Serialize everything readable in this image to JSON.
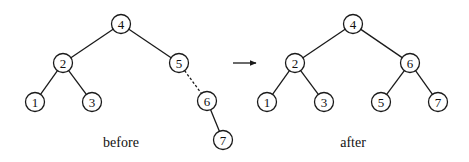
{
  "diagram": {
    "arrow": {
      "x1": 233,
      "y1": 63,
      "x2": 256,
      "y2": 63
    },
    "trees": [
      {
        "caption": "before",
        "caption_pos": [
          121,
          147
        ],
        "nodes": [
          {
            "id": "4",
            "label": "4",
            "x": 121,
            "y": 24
          },
          {
            "id": "2",
            "label": "2",
            "x": 63,
            "y": 63
          },
          {
            "id": "5",
            "label": "5",
            "x": 179,
            "y": 63
          },
          {
            "id": "1",
            "label": "1",
            "x": 35,
            "y": 102
          },
          {
            "id": "3",
            "label": "3",
            "x": 92,
            "y": 102
          },
          {
            "id": "6",
            "label": "6",
            "x": 207,
            "y": 101
          },
          {
            "id": "7",
            "label": "7",
            "x": 223,
            "y": 140
          }
        ],
        "edges": [
          {
            "from": "4",
            "to": "2",
            "style": "solid"
          },
          {
            "from": "4",
            "to": "5",
            "style": "solid"
          },
          {
            "from": "2",
            "to": "1",
            "style": "solid"
          },
          {
            "from": "2",
            "to": "3",
            "style": "solid"
          },
          {
            "from": "5",
            "to": "6",
            "style": "dashed"
          },
          {
            "from": "6",
            "to": "7",
            "style": "solid"
          }
        ]
      },
      {
        "caption": "after",
        "caption_pos": [
          353,
          147
        ],
        "nodes": [
          {
            "id": "4",
            "label": "4",
            "x": 353,
            "y": 24
          },
          {
            "id": "2",
            "label": "2",
            "x": 295,
            "y": 63
          },
          {
            "id": "6",
            "label": "6",
            "x": 410,
            "y": 63
          },
          {
            "id": "1",
            "label": "1",
            "x": 267,
            "y": 102
          },
          {
            "id": "3",
            "label": "3",
            "x": 324,
            "y": 102
          },
          {
            "id": "5",
            "label": "5",
            "x": 381,
            "y": 102
          },
          {
            "id": "7",
            "label": "7",
            "x": 438,
            "y": 102
          }
        ],
        "edges": [
          {
            "from": "4",
            "to": "2",
            "style": "solid"
          },
          {
            "from": "4",
            "to": "6",
            "style": "solid"
          },
          {
            "from": "2",
            "to": "1",
            "style": "solid"
          },
          {
            "from": "2",
            "to": "3",
            "style": "solid"
          },
          {
            "from": "6",
            "to": "5",
            "style": "solid"
          },
          {
            "from": "6",
            "to": "7",
            "style": "solid"
          }
        ]
      }
    ],
    "node_radius": 9.5
  }
}
